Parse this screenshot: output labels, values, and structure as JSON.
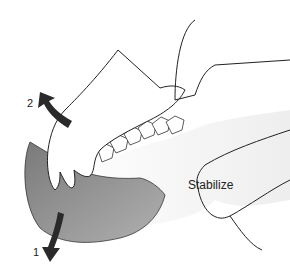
{
  "figure": {
    "labels": {
      "step1": "1",
      "step2": "2",
      "stabilize": "Stabilize"
    },
    "colors": {
      "background": "#ffffff",
      "skin": "#f4f4f4",
      "head_shade": "#8a8a8a",
      "arrow": "#2a2a2a",
      "line": "#222222"
    }
  }
}
